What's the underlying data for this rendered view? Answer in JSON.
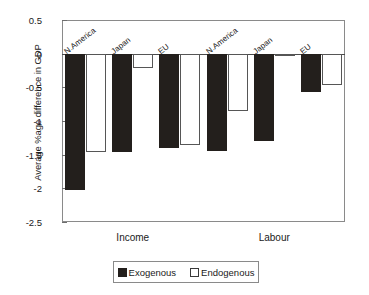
{
  "chart_data": {
    "type": "bar",
    "title": "",
    "xlabel": "",
    "ylabel": "Average %age difference in GDP",
    "ylim": [
      -2.5,
      0.5
    ],
    "ytick_labels": [
      "0.5",
      "0",
      "-0.5",
      "-1",
      "-1.5",
      "-2",
      "-2.5"
    ],
    "ytick_values": [
      0.5,
      0,
      -0.5,
      -1,
      -1.5,
      -2,
      -2.5
    ],
    "grid": false,
    "legend_position": "bottom",
    "groups": [
      "Income",
      "Labour"
    ],
    "categories": [
      "N.America",
      "Japan",
      "EU",
      "N.America",
      "Japan",
      "EU"
    ],
    "series": [
      {
        "name": "Exogenous",
        "color": "#231f1c",
        "values": [
          -2.02,
          -1.46,
          -1.4,
          -1.44,
          -1.29,
          -0.57
        ]
      },
      {
        "name": "Endogenous",
        "color": "#ffffff",
        "values": [
          -1.46,
          -0.22,
          -1.36,
          -0.85,
          -0.04,
          -0.47
        ]
      }
    ]
  },
  "axis": {
    "y_title": "Average %age difference in GDP"
  },
  "group_labels": [
    {
      "label": "Income"
    },
    {
      "label": "Labour"
    }
  ],
  "bar_labels": [
    {
      "label": "N.America"
    },
    {
      "label": "Japan"
    },
    {
      "label": "EU"
    },
    {
      "label": "N.America"
    },
    {
      "label": "Japan"
    },
    {
      "label": "EU"
    }
  ],
  "legend": {
    "entries": [
      {
        "label": "Exogenous",
        "swatch": "filled-square-icon"
      },
      {
        "label": "Endogenous",
        "swatch": "hollow-square-icon"
      }
    ]
  }
}
